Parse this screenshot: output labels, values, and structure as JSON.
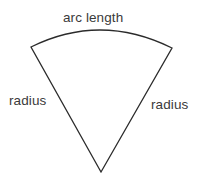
{
  "figure": {
    "name": "circular-sector-diagram",
    "background_color": "#ffffff",
    "stroke_color": "#2b2b2b",
    "text_color": "#3a3a3a",
    "stroke_width": 1.3,
    "labels": {
      "arc_length": "arc length",
      "radius_left": "radius",
      "radius_right": "radius"
    },
    "geometry": {
      "apex": [
        101,
        172
      ],
      "arc_start": [
        31,
        47
      ],
      "arc_end": [
        172,
        48
      ],
      "arc_peak": [
        101,
        30
      ],
      "arc_path": "M 31 47 Q 101 20 172 48"
    }
  }
}
